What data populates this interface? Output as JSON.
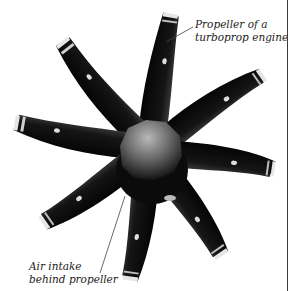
{
  "figure": {
    "blade_count": 8,
    "colors": {
      "background": "#ffffff",
      "blade": "#111111",
      "hub": "#8a8a8a",
      "label_text": "#222222",
      "border": "#3a3a3a"
    }
  },
  "labels": {
    "propeller": {
      "line1": "Propeller of a",
      "line2": "turboprop engine"
    },
    "air_intake": {
      "line1": "Air intake",
      "line2": "behind propeller"
    }
  }
}
